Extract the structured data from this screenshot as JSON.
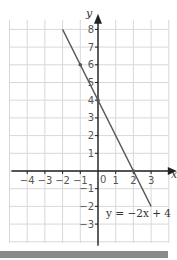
{
  "chart_data": {
    "type": "line",
    "title": "",
    "xlabel": "x",
    "ylabel": "y",
    "xlim": [
      -5,
      4
    ],
    "ylim": [
      -4,
      9
    ],
    "grid": true,
    "x_ticks": [
      -4,
      -3,
      -2,
      -1,
      0,
      1,
      2,
      3
    ],
    "y_ticks": [
      -3,
      -2,
      -1,
      1,
      2,
      3,
      4,
      5,
      6,
      7,
      8
    ],
    "series": [
      {
        "name": "y = -2x + 4",
        "equation": "y = −2x + 4",
        "x": [
          -2,
          3
        ],
        "y": [
          8,
          -2
        ],
        "color": "#555555"
      }
    ],
    "marked_points": [
      {
        "x": -1,
        "y": 6
      },
      {
        "x": 0,
        "y": 4
      },
      {
        "x": 2,
        "y": 0
      }
    ],
    "annotations": [
      {
        "text": "y = −2x + 4",
        "near": {
          "x": 2.1,
          "y": -2.4
        }
      }
    ],
    "origin_label": "0"
  },
  "labels": {
    "x_axis": "x",
    "y_axis": "y",
    "origin": "0",
    "equation": "y = −2x + 4"
  },
  "colors": {
    "grid": "#d8d8d8",
    "axis": "#222222",
    "line": "#555555",
    "bottom_bar": "#8a8a8a"
  }
}
